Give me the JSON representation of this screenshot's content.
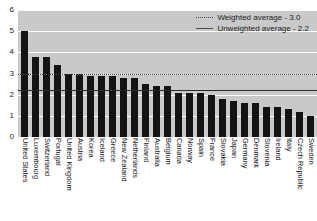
{
  "chart_data": {
    "type": "bar",
    "title": "",
    "xlabel": "",
    "ylabel": "",
    "ylim": [
      0,
      6
    ],
    "yticks": [
      0,
      1,
      2,
      3,
      4,
      5,
      6
    ],
    "grid": true,
    "legend_position": "top-right",
    "categories": [
      "United States",
      "Luxembourg",
      "Switzerland",
      "Portugal",
      "United Kingdom",
      "Austria",
      "Korea",
      "Iceland",
      "Greece",
      "New Zealand",
      "Netherlands",
      "Finland",
      "Australia",
      "Belgium",
      "Canada",
      "Norway",
      "Spain",
      "France",
      "Slovakia",
      "Japan",
      "Germany",
      "Denmark",
      "Slovenia",
      "Ireland",
      "Italy",
      "Czech Republic",
      "Sweden"
    ],
    "values": [
      5.0,
      3.8,
      3.8,
      3.4,
      3.0,
      3.0,
      2.9,
      2.9,
      2.9,
      2.8,
      2.8,
      2.5,
      2.4,
      2.4,
      2.1,
      2.1,
      2.1,
      2.0,
      1.8,
      1.7,
      1.6,
      1.6,
      1.4,
      1.4,
      1.3,
      1.2,
      1.0
    ],
    "reference_lines": [
      {
        "name": "weighted-average",
        "label": "Weighted average - 3.0",
        "value": 3.0,
        "style": "dotted"
      },
      {
        "name": "unweighted-average",
        "label": "Unweighted average - 2.2",
        "value": 2.2,
        "style": "solid"
      }
    ],
    "colors": {
      "bar": "#141414",
      "plot_background": "#c9c9c9",
      "gridline": "#ffffff",
      "reference_line": "#2a2a2a",
      "text": "#141414"
    }
  }
}
